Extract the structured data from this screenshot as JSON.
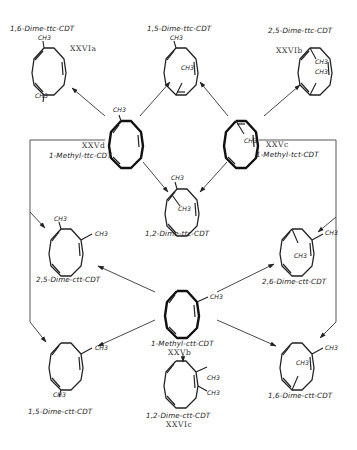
{
  "substituent_label": "CH3",
  "compounds": {
    "dime_16_ttc": {
      "name": "1,6-Dime-ttc-CDT",
      "code": "XXVIa"
    },
    "dime_15_ttc": {
      "name": "1,5-Dime-ttc-CDT",
      "code": ""
    },
    "dime_25_ttc": {
      "name": "2,5-Dime-ttc-CDT",
      "code": "XXVIb"
    },
    "methyl_ttc": {
      "name": "1-Methyl-ttc-CDT",
      "code": "XXVd"
    },
    "methyl_tct": {
      "name": "1-Methyl-tct-CDT",
      "code": "XXVc"
    },
    "dime_12_ttc": {
      "name": "1,2-Dime-ttc-CDT",
      "code": ""
    },
    "dime_25_ctt": {
      "name": "2,5-Dime-ctt-CDT",
      "code": ""
    },
    "dime_26_ctt": {
      "name": "2,6-Dime-ctt-CDT",
      "code": ""
    },
    "methyl_ctt": {
      "name": "1-Methyl-ctt-CDT",
      "code": "XXVb"
    },
    "dime_15_ctt": {
      "name": "1,5-Dime-ctt-CDT",
      "code": ""
    },
    "dime_12_ctt": {
      "name": "1,2-Dime-ctt-CDT",
      "code": "XXVIc"
    },
    "dime_16_ctt": {
      "name": "1,6-Dime-ctt-CDT",
      "code": ""
    }
  },
  "reactions": [
    {
      "from": "1-Methyl-ttc-CDT",
      "to": "1,6-Dime-ttc-CDT"
    },
    {
      "from": "1-Methyl-ttc-CDT",
      "to": "1,5-Dime-ttc-CDT"
    },
    {
      "from": "1-Methyl-tct-CDT",
      "to": "1,5-Dime-ttc-CDT"
    },
    {
      "from": "1-Methyl-tct-CDT",
      "to": "2,5-Dime-ttc-CDT"
    },
    {
      "from": "1-Methyl-ttc-CDT",
      "to": "1,2-Dime-ttc-CDT"
    },
    {
      "from": "1-Methyl-tct-CDT",
      "to": "1,2-Dime-ttc-CDT"
    },
    {
      "from": "1-Methyl-ttc-CDT",
      "to": "2,5-Dime-ctt-CDT"
    },
    {
      "from": "1-Methyl-ttc-CDT",
      "to": "1,5-Dime-ctt-CDT"
    },
    {
      "from": "1-Methyl-tct-CDT",
      "to": "2,6-Dime-ctt-CDT"
    },
    {
      "from": "1-Methyl-tct-CDT",
      "to": "1,6-Dime-ctt-CDT"
    },
    {
      "from": "1-Methyl-ctt-CDT",
      "to": "2,5-Dime-ctt-CDT"
    },
    {
      "from": "1-Methyl-ctt-CDT",
      "to": "2,6-Dime-ctt-CDT"
    },
    {
      "from": "1-Methyl-ctt-CDT",
      "to": "1,5-Dime-ctt-CDT"
    },
    {
      "from": "1-Methyl-ctt-CDT",
      "to": "1,6-Dime-ctt-CDT"
    },
    {
      "from": "1-Methyl-ctt-CDT",
      "to": "1,2-Dime-ctt-CDT"
    }
  ]
}
